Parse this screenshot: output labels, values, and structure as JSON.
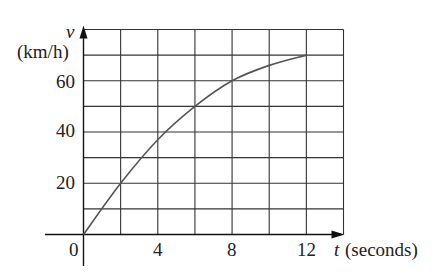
{
  "chart_data": {
    "type": "line",
    "title": "",
    "xlabel": "t (seconds)",
    "xlabel_var": "t",
    "xlabel_unit": "(seconds)",
    "ylabel": "v (km/h)",
    "ylabel_var": "v",
    "ylabel_unit": "(km/h)",
    "xlim": [
      0,
      14
    ],
    "ylim": [
      0,
      80
    ],
    "x_ticks": [
      0,
      4,
      8,
      12
    ],
    "y_ticks": [
      20,
      40,
      60
    ],
    "origin_label": "0",
    "grid": true,
    "grid_x_step": 2,
    "grid_y_step": 10,
    "legend": null,
    "series": [
      {
        "name": "velocity",
        "x": [
          0,
          2,
          4,
          6,
          8,
          10,
          12
        ],
        "values": [
          0,
          20,
          37,
          50,
          60,
          66,
          70
        ],
        "color": "#555555"
      }
    ]
  },
  "labels": {
    "y_var": "v",
    "y_unit": "(km/h)",
    "y60": "60",
    "y40": "40",
    "y20": "20",
    "origin": "0",
    "x4": "4",
    "x8": "8",
    "x12": "12",
    "x_var": "t",
    "x_unit": "(seconds)"
  },
  "colors": {
    "grid": "#333333",
    "curve": "#555555",
    "axis": "#111111"
  }
}
